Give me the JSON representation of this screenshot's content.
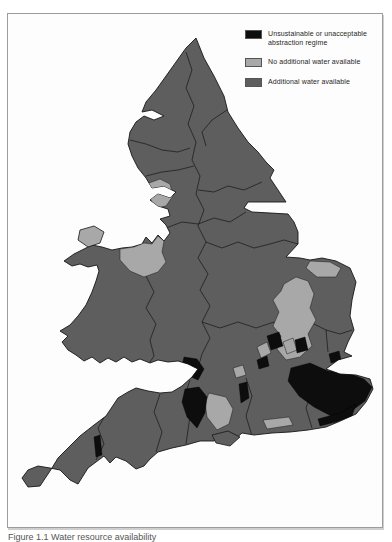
{
  "figure": {
    "caption": "Figure 1.1 Water resource availability"
  },
  "legend": {
    "items": [
      {
        "id": "unsustainable",
        "label": "Unsustainable or unacceptable abstraction regime",
        "color": "#0d0d0d"
      },
      {
        "id": "no-additional",
        "label": "No additional water available",
        "color": "#a8a8a8"
      },
      {
        "id": "additional",
        "label": "Additional water available",
        "color": "#5e5e5e"
      }
    ]
  },
  "map": {
    "sea_color": "#fdfdfd",
    "boundary_color": "#161616"
  }
}
